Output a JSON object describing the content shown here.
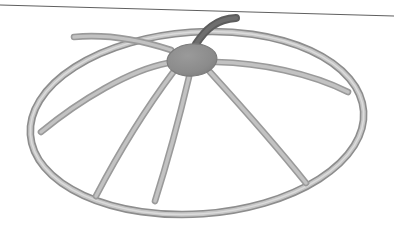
{
  "canvas": {
    "width": 394,
    "height": 237,
    "background": "#ffffff",
    "title": "3D wireframe dome frame"
  },
  "palette": {
    "background": "#ffffff",
    "tube_edge": "#8d8d8d",
    "tube_core": "#c6c6c6",
    "tube_highlight": "#dcdcdc",
    "hub_fill": "#8e8e8e",
    "hub_edge": "#7c7c7c",
    "spoke_edge": "#9a9a9a",
    "spoke_core": "#c2c2c2",
    "dark_spoke": "#5c5c5c",
    "dark_spoke_core": "#6e6e6e",
    "horizon_line": "#5f5f5f"
  },
  "horizon": {
    "name": "horizon-line",
    "x1": 0,
    "y1": 5,
    "x2": 394,
    "y2": 16,
    "stroke_width": 1.2,
    "color": "#5f5f5f"
  },
  "rim": {
    "name": "outer-rim-ellipse",
    "center_x": 197,
    "center_y": 123,
    "radius_x": 167,
    "radius_y": 91,
    "rotation_deg": -4,
    "tube_width": 7.5,
    "description": "elliptical outer rim drawn as a tube with dark edges and light core"
  },
  "hub": {
    "name": "center-hub",
    "center_x": 192,
    "center_y": 60,
    "radius_x": 25,
    "radius_y": 16,
    "rotation_deg": -5,
    "fill": "#8e8e8e"
  },
  "spokes": [
    {
      "name": "spoke-west",
      "label": "Spoke W",
      "dark": false,
      "path": "M 168 63 C 130 70 80 100 41 132"
    },
    {
      "name": "spoke-northwest",
      "label": "Spoke NW",
      "dark": false,
      "path": "M 171 50 C 140 40 105 34 74 37"
    },
    {
      "name": "spoke-southwest",
      "label": "Spoke SW",
      "dark": false,
      "path": "M 174 71 C 150 103 120 150 96 196"
    },
    {
      "name": "spoke-south",
      "label": "Spoke S",
      "dark": false,
      "path": "M 189 77 C 180 115 168 160 155 201"
    },
    {
      "name": "spoke-southeast",
      "label": "Spoke SE",
      "dark": false,
      "path": "M 210 72 C 240 105 278 148 306 183"
    },
    {
      "name": "spoke-east",
      "label": "Spoke E",
      "dark": false,
      "path": "M 216 62 C 260 63 310 73 348 92"
    },
    {
      "name": "spoke-northeast-dark",
      "label": "Spoke NE (shadowed)",
      "dark": true,
      "path": "M 196 44 C 205 30 216 19 236 18"
    }
  ],
  "labels": {
    "scene_name": "dome-frame-scene",
    "object_name": "umbrella-dome-wireframe"
  }
}
